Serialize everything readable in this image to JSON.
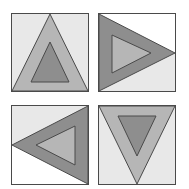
{
  "figure": {
    "colors": {
      "stroke": "#4a4a4a",
      "light_bg": "#e8e8e8",
      "white_bg": "#ffffff",
      "medium_fill": "#b6b6b6",
      "dark_fill": "#8e8e8e"
    },
    "panels": [
      {
        "id": "top-left",
        "orientation": "up",
        "x": 11,
        "y": 13,
        "w": 78,
        "h": 79,
        "background_top": "#e8e8e8",
        "background_bottom": "#e8e8e8",
        "outer_fill": "#b6b6b6",
        "inner_fill": "#8e8e8e"
      },
      {
        "id": "top-right",
        "orientation": "right",
        "x": 98,
        "y": 13,
        "w": 78,
        "h": 79,
        "background_top": "#ffffff",
        "background_bottom": "#e8e8e8",
        "outer_fill": "#8e8e8e",
        "inner_fill": "#b6b6b6"
      },
      {
        "id": "bottom-left",
        "orientation": "left",
        "x": 11,
        "y": 105,
        "w": 78,
        "h": 80,
        "background_top": "#e8e8e8",
        "background_bottom": "#ffffff",
        "outer_fill": "#8e8e8e",
        "inner_fill": "#b6b6b6"
      },
      {
        "id": "bottom-right",
        "orientation": "down",
        "x": 98,
        "y": 105,
        "w": 78,
        "h": 80,
        "background_top": "#e8e8e8",
        "background_bottom": "#e8e8e8",
        "outer_fill": "#b6b6b6",
        "inner_fill": "#8e8e8e"
      }
    ]
  }
}
